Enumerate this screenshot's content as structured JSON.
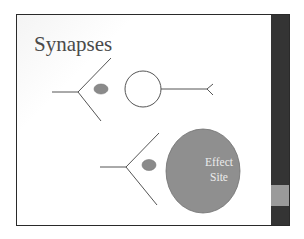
{
  "slide": {
    "title": "Synapses",
    "colors": {
      "sidebar": "#343434",
      "sidebar_band": "#9a9a9a",
      "neurotransmitter_fill": "#8a8a8a",
      "effect_site_fill": "#8f8f8f",
      "line": "#555555"
    },
    "diagram": {
      "top_synapse": {
        "elements": [
          "axon-terminal",
          "neurotransmitter",
          "receiving-neuron-cell-body",
          "receiving-axon"
        ]
      },
      "bottom_synapse": {
        "elements": [
          "axon-terminal",
          "neurotransmitter",
          "effect-site"
        ],
        "effect_site_label_line1": "Effect",
        "effect_site_label_line2": "Site"
      }
    }
  }
}
